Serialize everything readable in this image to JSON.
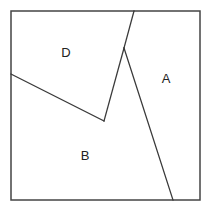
{
  "diagram": {
    "width": 211,
    "height": 212,
    "frame": {
      "x": 11,
      "y": 11,
      "width": 189,
      "height": 189
    },
    "regions": [
      {
        "id": "D",
        "label": "D",
        "label_pos": [
          66,
          52
        ]
      },
      {
        "id": "A",
        "label": "A",
        "label_pos": [
          166,
          78
        ]
      },
      {
        "id": "B",
        "label": "B",
        "label_pos": [
          85,
          155
        ]
      }
    ],
    "edges": [
      {
        "name": "d-a-boundary-top",
        "from": [
          134,
          11
        ],
        "to": [
          124,
          48
        ]
      },
      {
        "name": "d-b-boundary-right",
        "from": [
          124,
          48
        ],
        "to": [
          104,
          121
        ]
      },
      {
        "name": "d-b-boundary-bottom",
        "from": [
          104,
          121
        ],
        "to": [
          11,
          74
        ]
      },
      {
        "name": "a-b-boundary",
        "from": [
          124,
          48
        ],
        "to": [
          173,
          200
        ]
      }
    ],
    "colors": {
      "stroke": "#3a3a3a",
      "text": "#222222",
      "background": "#ffffff"
    }
  }
}
